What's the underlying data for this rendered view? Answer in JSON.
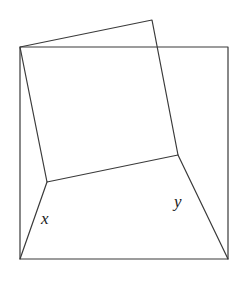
{
  "figure": {
    "background_color": "#ffffff",
    "stroke_color": "#3a3a3a",
    "stroke_width": 1.2,
    "width": 243,
    "height": 283,
    "outer_square": {
      "name": "outer-square",
      "points": "20,47 228,47 228,259 20,259",
      "closed": true,
      "vertices": [
        {
          "label": "top-left",
          "x": 20,
          "y": 47
        },
        {
          "label": "top-right",
          "x": 228,
          "y": 47
        },
        {
          "label": "bottom-right",
          "x": 228,
          "y": 259
        },
        {
          "label": "bottom-left",
          "x": 20,
          "y": 259
        }
      ]
    },
    "tilted_quad": {
      "name": "tilted-quadrilateral",
      "points": "20,47 152,20 178,155 47,182",
      "closed": true,
      "vertices": [
        {
          "label": "shared-top-left",
          "x": 20,
          "y": 47
        },
        {
          "label": "apex",
          "x": 152,
          "y": 20
        },
        {
          "label": "right-junction",
          "x": 178,
          "y": 155
        },
        {
          "label": "left-junction",
          "x": 47,
          "y": 182
        }
      ]
    },
    "angle_leg_left": {
      "name": "angle-leg-left",
      "points": "47,182 20,259"
    },
    "angle_leg_right": {
      "name": "angle-leg-right",
      "points": "178,155 228,259"
    },
    "labels": [
      {
        "name": "angle-label-x",
        "text": "x",
        "x": 41,
        "y": 210,
        "font_size": 17
      },
      {
        "name": "angle-label-y",
        "text": "y",
        "x": 174,
        "y": 193,
        "font_size": 17
      }
    ]
  }
}
